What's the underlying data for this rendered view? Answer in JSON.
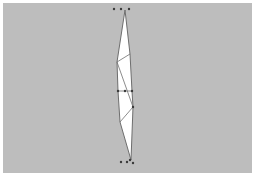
{
  "diagram": {
    "background_color": "#bdbdbd",
    "fill_color": "#ffffff",
    "stroke_color": "#6e6e6e",
    "point_color": "#3a3a3a",
    "outline": [
      [
        125,
        10
      ],
      [
        117,
        62
      ],
      [
        118,
        91
      ],
      [
        120,
        122
      ],
      [
        131,
        160
      ],
      [
        133,
        107
      ],
      [
        132,
        91
      ],
      [
        130,
        54
      ]
    ],
    "fold_lines": [
      [
        [
          117,
          62
        ],
        [
          130,
          54
        ]
      ],
      [
        [
          117,
          62
        ],
        [
          133,
          107
        ]
      ],
      [
        [
          120,
          122
        ],
        [
          133,
          107
        ]
      ],
      [
        [
          118,
          91
        ],
        [
          132,
          91
        ]
      ]
    ],
    "points": [
      [
        114,
        9
      ],
      [
        121,
        9
      ],
      [
        129,
        9
      ],
      [
        118,
        91
      ],
      [
        125,
        91
      ],
      [
        132,
        91
      ],
      [
        121,
        162
      ],
      [
        127,
        162
      ],
      [
        130,
        160
      ],
      [
        133,
        163
      ],
      [
        133,
        107
      ]
    ]
  }
}
